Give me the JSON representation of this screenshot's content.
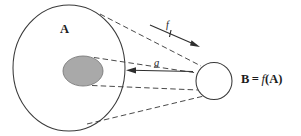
{
  "figure": {
    "name": "set-mapping-diagram",
    "background_color": "#ffffff"
  },
  "sets": {
    "domain": {
      "label": "A",
      "shape": "ellipse",
      "center_x": 69,
      "center_y": 68,
      "radius_x": 56,
      "radius_y": 63,
      "fill": "none",
      "stroke": "#3a3a3a"
    },
    "subset": {
      "label": "",
      "shape": "ellipse",
      "center_x": 83,
      "center_y": 71,
      "radius_x": 20,
      "radius_y": 15,
      "fill": "#a9a9a9",
      "stroke": "#7b7b7b"
    },
    "codomain": {
      "label": "B = f(A)",
      "label_parts": {
        "set_name": "B",
        "equals": "=",
        "function_name": "f",
        "open_paren": "(",
        "argument": "A",
        "close_paren": ")"
      },
      "shape": "circle",
      "center_x": 214,
      "center_y": 81,
      "radius_x": 18,
      "radius_y": 18.5,
      "fill": "none",
      "stroke": "#3a3a3a"
    }
  },
  "maps": [
    {
      "label": "f",
      "direction": "forward",
      "from": "A",
      "to": "B",
      "style": "solid-arrow",
      "x1": 152,
      "y1": 26,
      "x2": 200,
      "y2": 47
    },
    {
      "label": "g",
      "direction": "backward",
      "from": "B",
      "to": "A",
      "style": "solid-arrow",
      "x1": 192,
      "y1": 71,
      "x2": 126,
      "y2": 70
    }
  ],
  "projection_lines": [
    {
      "name": "upper-outer",
      "x1": 100,
      "y1": 14,
      "x2": 200,
      "y2": 66
    },
    {
      "name": "lower-outer",
      "x1": 87,
      "y1": 124,
      "x2": 203,
      "y2": 95
    },
    {
      "name": "upper-inner",
      "x1": 95,
      "y1": 58,
      "x2": 197,
      "y2": 73
    },
    {
      "name": "lower-inner",
      "x1": 92,
      "y1": 85,
      "x2": 198,
      "y2": 89
    }
  ],
  "colors": {
    "line": "#3a3a3a",
    "dashed_line": "#4a4a4a",
    "subset_fill": "#a9a9a9",
    "subset_stroke": "#7b7b7b",
    "text": "#1c1c1c",
    "arrow": "#2e2e2e"
  }
}
